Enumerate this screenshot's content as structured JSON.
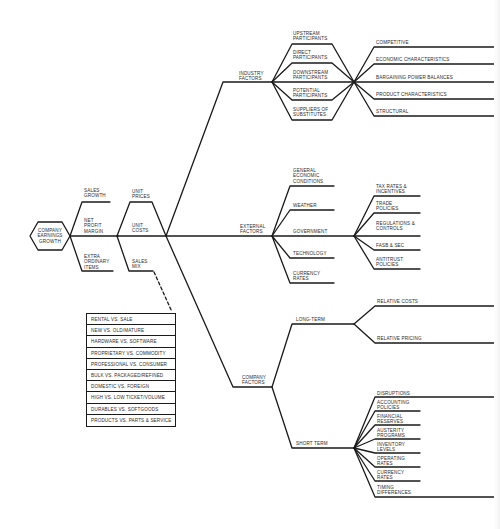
{
  "root": {
    "label": "COMPANY\nEARNINGS\nGROWTH"
  },
  "level1": [
    {
      "label": "SALES\nGROWTH"
    },
    {
      "label": "NET\nPROFIT\nMARGIN"
    },
    {
      "label": "EXTRA\nORDINARY\nITEMS"
    }
  ],
  "level2": [
    {
      "label": "UNIT\nPRICES"
    },
    {
      "label": "UNIT\nCOSTS"
    },
    {
      "label": "SALES\nMIX"
    }
  ],
  "factors": {
    "industry": {
      "label": "INDUSTRY\nFACTORS",
      "participants": [
        "UPSTREAM\nPARTICIPANTS",
        "DIRECT\nPARTICIPANTS",
        "DOWNSTREAM\nPARTICIPANTS",
        "POTENTIAL\nPARTICIPANTS",
        "SUPPLIERS OF\nSUBSTITUTES"
      ],
      "characteristics": [
        "COMPETITIVE",
        "ECONOMIC CHARACTERISTICS",
        "BARGAINING POWER BALANCES",
        "PRODUCT CHARACTERISTICS",
        "STRUCTURAL"
      ]
    },
    "external": {
      "label": "EXTERNAL\nFACTORS",
      "items": [
        "GENERAL\nECONOMIC\nCONDITIONS",
        "WEATHER",
        "GOVERNMENT",
        "TECHNOLOGY",
        "CURRENCY\nRATES"
      ],
      "government": [
        "TAX RATES &\nINCENTIVES",
        "TRADE\nPOLICIES",
        "REGULATIONS &\nCONTROLS",
        "FASB & SEC",
        "ANTITRUST\nPOLICIES"
      ]
    },
    "company": {
      "label": "COMPANY\nFACTORS",
      "long_term": {
        "label": "LONG-TERM",
        "items": [
          "RELATIVE COSTS",
          "RELATIVE PRICING"
        ]
      },
      "short_term": {
        "label": "SHORT TERM",
        "items": [
          "DISRUPTIONS",
          "ACCOUNTING\nPOLICIES",
          "FINANCIAL\nRESERVES",
          "AUSTERITY\nPROGRAMS",
          "INVENTORY\nLEVELS",
          "OPERATING\nRATES",
          "CURRENCY\nRATES",
          "TIMING\nDIFFERENCES"
        ]
      }
    }
  },
  "sales_mix_items": [
    "RENTAL VS. SALE",
    "NEW VS. OLD/MATURE",
    "HARDWARE VS. SOFTWARE",
    "PROPRIETARY VS. COMMODITY",
    "PROFESSIONAL VS. CONSUMER",
    "BULK VS. PACKAGED/REFINED",
    "DOMESTIC VS. FOREIGN",
    "HIGH VS. LOW TICKET/VOLUME",
    "DURABLES VS. SOFTGOODS",
    "PRODUCTS VS. PARTS & SERVICE"
  ],
  "colors": {
    "line": "#1a1a1a",
    "text": "#2a2a2a",
    "background": "#ffffff"
  }
}
